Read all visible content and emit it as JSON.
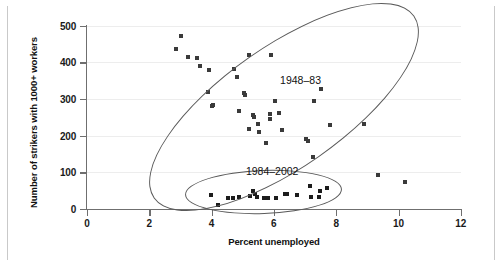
{
  "chart_data": {
    "type": "scatter",
    "title": "",
    "xlabel": "Percent unemployed",
    "ylabel": "Number of strikers with 1000+ workers",
    "xlim": [
      0,
      12
    ],
    "ylim": [
      0,
      500
    ],
    "xticks": [
      "0",
      "2",
      "4",
      "6",
      "8",
      "10",
      "12"
    ],
    "xtick_values": [
      0,
      2,
      4,
      6,
      8,
      10,
      12
    ],
    "yticks": [
      "0",
      "100",
      "200",
      "300",
      "400",
      "500"
    ],
    "ytick_values": [
      0,
      100,
      200,
      300,
      400,
      500
    ],
    "grid": "horizontal",
    "legend": "none",
    "annotations": [
      {
        "text": "1948–83",
        "x": 6.2,
        "y": 350
      },
      {
        "text": "1984–2002",
        "x": 5.1,
        "y": 100
      }
    ],
    "series": [
      {
        "name": "1948–83",
        "marker": "square",
        "color": "#3a3a3a",
        "points": [
          [
            3.02,
            473
          ],
          [
            2.85,
            437
          ],
          [
            3.25,
            415
          ],
          [
            3.53,
            411
          ],
          [
            3.62,
            390
          ],
          [
            3.9,
            380
          ],
          [
            5.2,
            421
          ],
          [
            5.9,
            421
          ],
          [
            4.72,
            381
          ],
          [
            4.8,
            360
          ],
          [
            5.04,
            317
          ],
          [
            3.88,
            320
          ],
          [
            5.07,
            312
          ],
          [
            4.04,
            285
          ],
          [
            4.0,
            280
          ],
          [
            6.03,
            296
          ],
          [
            4.87,
            267
          ],
          [
            5.32,
            256
          ],
          [
            5.36,
            250
          ],
          [
            5.87,
            258
          ],
          [
            5.87,
            247
          ],
          [
            6.17,
            261
          ],
          [
            5.2,
            219
          ],
          [
            5.5,
            232
          ],
          [
            5.52,
            211
          ],
          [
            6.25,
            217
          ],
          [
            5.75,
            179
          ],
          [
            7.5,
            328
          ],
          [
            7.28,
            294
          ],
          [
            7.79,
            228
          ],
          [
            8.89,
            231
          ],
          [
            7.04,
            192
          ],
          [
            7.08,
            187
          ],
          [
            7.25,
            141
          ],
          [
            9.34,
            93
          ],
          [
            10.2,
            75
          ]
        ]
      },
      {
        "name": "1984–2002",
        "marker": "square",
        "color": "#1c1c1c",
        "points": [
          [
            3.97,
            38
          ],
          [
            4.21,
            12
          ],
          [
            4.53,
            31
          ],
          [
            4.88,
            32
          ],
          [
            5.23,
            36
          ],
          [
            5.32,
            48
          ],
          [
            5.4,
            42
          ],
          [
            5.46,
            33
          ],
          [
            5.68,
            30
          ],
          [
            5.82,
            30
          ],
          [
            6.35,
            41
          ],
          [
            6.42,
            41
          ],
          [
            6.73,
            38
          ],
          [
            7.15,
            63
          ],
          [
            7.18,
            33
          ],
          [
            7.44,
            33
          ],
          [
            7.47,
            50
          ],
          [
            7.7,
            57
          ],
          [
            6.05,
            30
          ],
          [
            4.7,
            30
          ]
        ]
      }
    ],
    "clusters": [
      {
        "label": "1948–83",
        "shape": "ellipse",
        "rotation_deg": -35
      },
      {
        "label": "1984–2002",
        "shape": "ellipse",
        "rotation_deg": 0
      }
    ]
  }
}
